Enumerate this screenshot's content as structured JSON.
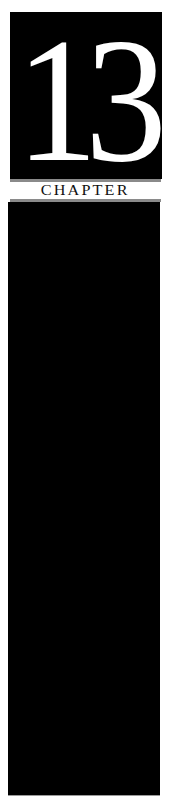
{
  "chapter": {
    "number": "13",
    "label": "CHAPTER"
  },
  "colors": {
    "background": "#ffffff",
    "block": "#000000",
    "number_text": "#ffffff",
    "rule": "#8a8a8a",
    "label_text": "#111111"
  }
}
